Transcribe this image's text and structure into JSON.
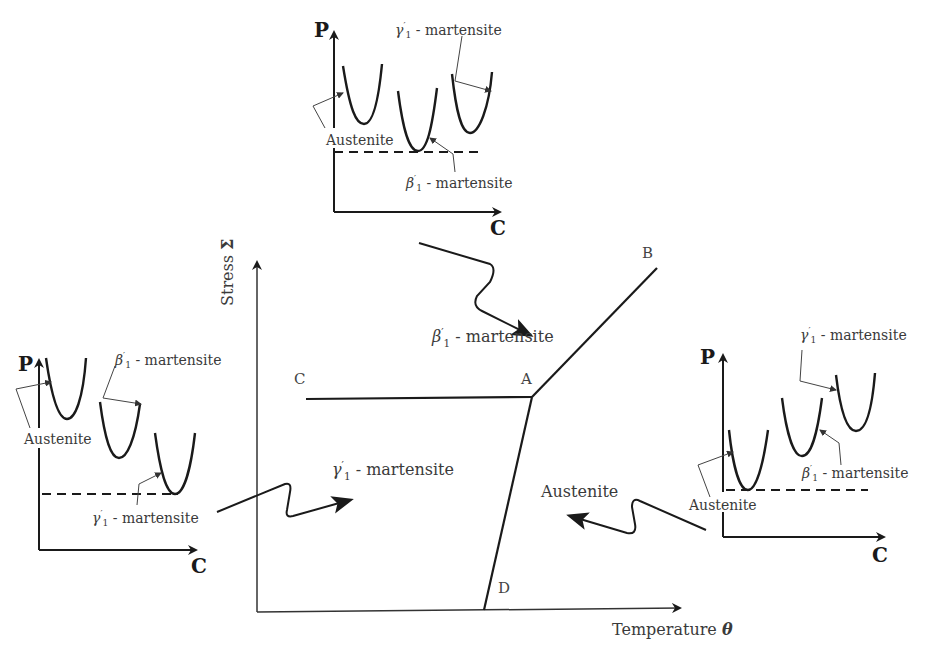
{
  "diagram": {
    "type": "phase-diagram",
    "main_axes": {
      "y_label": "Stress",
      "y_symbol": "Σ",
      "x_label": "Temperature",
      "x_symbol": "θ"
    },
    "points": {
      "A": "A",
      "B": "B",
      "C": "C",
      "D": "D"
    },
    "regions": {
      "beta": {
        "symbol": "β",
        "prime": "′",
        "sub": "1",
        "text": " - martensite"
      },
      "gamma": {
        "symbol": "γ",
        "prime": "′",
        "sub": "1",
        "text": " - martensite"
      },
      "austenite": "Austenite"
    },
    "panels": {
      "top": {
        "y_axis": "P",
        "x_axis": "C",
        "labels": {
          "austenite": "Austenite",
          "gamma": {
            "symbol": "γ",
            "prime": "′",
            "sub": "1",
            "text": " - martensite"
          },
          "beta": {
            "symbol": "β",
            "prime": "′",
            "sub": "1",
            "text": " - martensite"
          }
        },
        "stable_phase": "β′1 - martensite"
      },
      "left": {
        "y_axis": "P",
        "x_axis": "C",
        "labels": {
          "austenite": "Austenite",
          "beta": {
            "symbol": "β",
            "prime": "′",
            "sub": "1",
            "text": " - martensite"
          },
          "gamma": {
            "symbol": "γ",
            "prime": "′",
            "sub": "1",
            "text": " - martensite"
          }
        },
        "stable_phase": "γ′1 - martensite"
      },
      "right": {
        "y_axis": "P",
        "x_axis": "C",
        "labels": {
          "austenite": "Austenite",
          "gamma": {
            "symbol": "γ",
            "prime": "′",
            "sub": "1",
            "text": " - martensite"
          },
          "beta": {
            "symbol": "β",
            "prime": "′",
            "sub": "1",
            "text": " - martensite"
          }
        },
        "stable_phase": "Austenite"
      }
    },
    "colors": {
      "ink": "#1a1a1a",
      "thin": "#444444",
      "bg": "#ffffff"
    }
  }
}
